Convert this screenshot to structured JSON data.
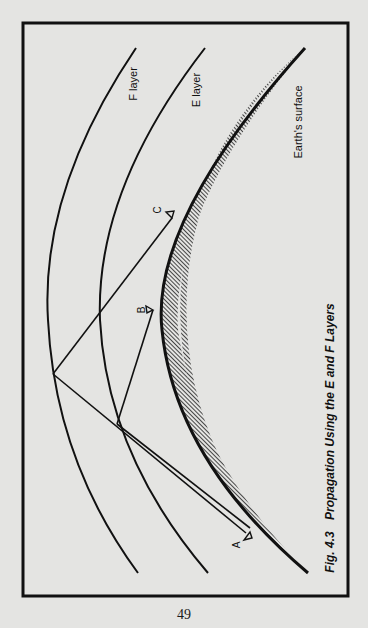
{
  "figure": {
    "caption": "Fig. 4.3  Propagation Using the E and F Layers",
    "caption_number": "Fig. 4.3",
    "caption_title": "Propagation Using the E and F Layers",
    "labels": {
      "f_layer": "F layer",
      "e_layer": "E layer",
      "earth_surface": "Earth's surface",
      "station_a": "A",
      "station_b": "B",
      "station_c": "C"
    },
    "colors": {
      "background": "#e4e4e2",
      "ink": "#111111"
    }
  },
  "page": {
    "number": "49"
  }
}
